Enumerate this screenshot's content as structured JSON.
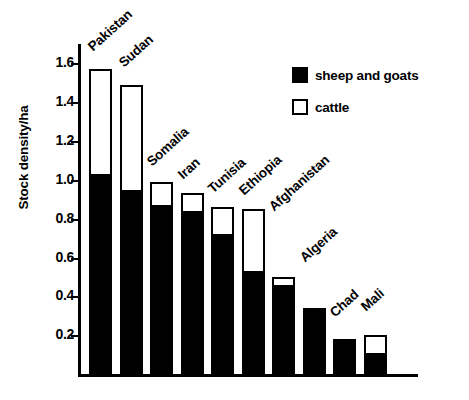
{
  "chart_data": {
    "type": "bar",
    "subtype": "stacked-vertical",
    "title": "",
    "xlabel": "",
    "ylabel": "Stock density/ha",
    "ylim": [
      0,
      1.7
    ],
    "ytick_labels": [
      "0.2",
      "0.4",
      "0.6",
      "0.8",
      "1.0",
      "1.2",
      "1.4",
      "1.6"
    ],
    "ytick_values": [
      0.2,
      0.4,
      0.6,
      0.8,
      1.0,
      1.2,
      1.4,
      1.6
    ],
    "grid": false,
    "legend_position": "top-right",
    "categories": [
      "Pakistan",
      "Sudan",
      "Somalia",
      "Iran",
      "Tunisia",
      "Ethiopia",
      "Afghanistan",
      "Algeria",
      "Chad",
      "Mali"
    ],
    "series": [
      {
        "name": "sheep and goats",
        "color": "#000000",
        "values": [
          1.02,
          0.94,
          0.86,
          0.83,
          0.71,
          0.52,
          0.45,
          0.33,
          0.17,
          0.1
        ]
      },
      {
        "name": "cattle",
        "color": "#ffffff",
        "values": [
          0.55,
          0.55,
          0.13,
          0.1,
          0.15,
          0.33,
          0.05,
          0.0,
          0.0,
          0.1
        ]
      }
    ],
    "totals": [
      1.57,
      1.49,
      0.99,
      0.93,
      0.86,
      0.85,
      0.5,
      0.33,
      0.17,
      0.2
    ]
  },
  "legend": {
    "items": [
      {
        "label": "sheep and goats",
        "swatch": "filled-square-icon"
      },
      {
        "label": "cattle",
        "swatch": "hollow-square-icon"
      }
    ]
  }
}
